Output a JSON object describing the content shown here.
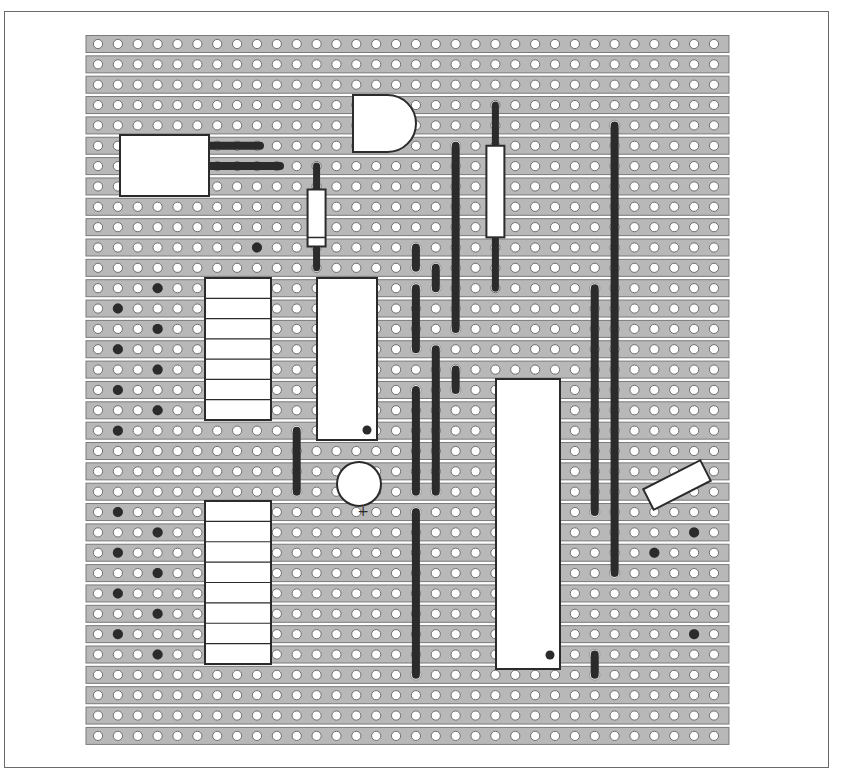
{
  "diagram": {
    "board": {
      "columns": 32,
      "rows": 35,
      "origin_x": 98,
      "origin_y": 44,
      "pitch_x": 19.87,
      "pitch_y": 20.35,
      "strip_color": "#b8b8b8",
      "strip_border": "#7a7a7a",
      "hole_color": "#ffffff",
      "hole_border": "#6f6f6f"
    },
    "colors": {
      "wire": "#2b2b2b",
      "component_fill": "#ffffff",
      "component_stroke": "#2b2b2b",
      "track_cut": "#2b2b2b"
    },
    "components": [
      {
        "id": "connector",
        "type": "box",
        "x": 120,
        "y": 135,
        "w": 89,
        "h": 61
      },
      {
        "id": "regulator",
        "type": "d-shape",
        "x": 353,
        "y": 95,
        "w": 63,
        "h": 57
      },
      {
        "id": "resistor-1",
        "type": "resistor",
        "col": 11,
        "row_from": 6,
        "row_to": 11,
        "body_from": 7.15,
        "body_to": 9.95,
        "band": true
      },
      {
        "id": "resistor-2",
        "type": "resistor",
        "col": 20,
        "row_from": 3,
        "row_to": 12,
        "body_from": 5,
        "body_to": 9.5,
        "band": false
      },
      {
        "id": "header-1",
        "type": "header",
        "x": 205,
        "y": 278,
        "w": 66,
        "h": 142,
        "pins": 7
      },
      {
        "id": "header-2",
        "type": "header",
        "x": 205,
        "y": 501,
        "w": 66,
        "h": 163,
        "pins": 8
      },
      {
        "id": "ic-small",
        "type": "ic",
        "x": 317,
        "y": 278,
        "w": 60,
        "h": 162,
        "dot_x": 367,
        "dot_y": 430
      },
      {
        "id": "ic-large",
        "type": "ic",
        "x": 496,
        "y": 379,
        "w": 64,
        "h": 290,
        "dot_x": 550,
        "dot_y": 655
      },
      {
        "id": "capacitor",
        "type": "circle",
        "cx": 359,
        "cy": 484,
        "r": 22,
        "polarity_label": "+",
        "label_x": 363,
        "label_y": 516
      },
      {
        "id": "diode-angled",
        "type": "angled-box",
        "cx": 677,
        "cy": 485,
        "w": 64,
        "h": 23,
        "angle": -27
      }
    ],
    "wires": [
      {
        "col": null,
        "orient": "h",
        "row": 5,
        "x1": 211,
        "x2": 260
      },
      {
        "col": null,
        "orient": "h",
        "row": 6,
        "x1": 211,
        "x2": 280
      },
      {
        "col": 18,
        "row_from": 5,
        "row_to": 14
      },
      {
        "col": 26,
        "row_from": 4,
        "row_to": 26
      },
      {
        "col": 16,
        "row_from": 10,
        "row_to": 11
      },
      {
        "col": 17,
        "row_from": 11,
        "row_to": 12
      },
      {
        "col": 16,
        "row_from": 12,
        "row_to": 15
      },
      {
        "col": 17,
        "row_from": 15,
        "row_to": 22
      },
      {
        "col": 18,
        "row_from": 16,
        "row_to": 17
      },
      {
        "col": 16,
        "row_from": 17,
        "row_to": 22
      },
      {
        "col": 16,
        "row_from": 23,
        "row_to": 31
      },
      {
        "col": 10,
        "row_from": 19,
        "row_to": 22
      },
      {
        "col": 25,
        "row_from": 12,
        "row_to": 23
      },
      {
        "col": 25,
        "row_from": 30,
        "row_to": 31
      }
    ],
    "track_cuts": [
      {
        "col": 8,
        "row": 10
      },
      {
        "col": 3,
        "row": 12
      },
      {
        "col": 1,
        "row": 13
      },
      {
        "col": 3,
        "row": 14
      },
      {
        "col": 1,
        "row": 15
      },
      {
        "col": 3,
        "row": 16
      },
      {
        "col": 1,
        "row": 17
      },
      {
        "col": 3,
        "row": 18
      },
      {
        "col": 1,
        "row": 19
      },
      {
        "col": 1,
        "row": 23
      },
      {
        "col": 3,
        "row": 24
      },
      {
        "col": 1,
        "row": 25
      },
      {
        "col": 3,
        "row": 26
      },
      {
        "col": 1,
        "row": 27
      },
      {
        "col": 3,
        "row": 28
      },
      {
        "col": 1,
        "row": 29
      },
      {
        "col": 3,
        "row": 30
      },
      {
        "col": 30,
        "row": 24
      },
      {
        "col": 28,
        "row": 25
      },
      {
        "col": 30,
        "row": 29
      }
    ]
  }
}
